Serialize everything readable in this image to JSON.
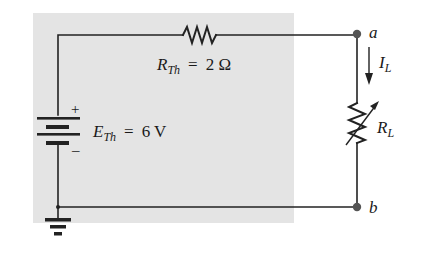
{
  "diagram": {
    "type": "thevenin-equivalent-circuit",
    "colors": {
      "shade": "#e4e4e4",
      "wire": "#222222",
      "terminal": "#555555",
      "background": "#ffffff"
    },
    "components": {
      "source": {
        "symbol": "E",
        "subscript": "Th",
        "equals": "=",
        "value": "6 V",
        "plus": "+",
        "minus": "–"
      },
      "series_resistor": {
        "symbol": "R",
        "subscript": "Th",
        "equals": "=",
        "value": "2 Ω"
      },
      "load_resistor": {
        "symbol": "R",
        "subscript": "L",
        "variable": true
      },
      "current": {
        "symbol": "I",
        "subscript": "L",
        "direction": "down"
      },
      "terminals": [
        {
          "id": "a",
          "label": "a"
        },
        {
          "id": "b",
          "label": "b"
        }
      ],
      "ground": {
        "present": true
      }
    }
  }
}
